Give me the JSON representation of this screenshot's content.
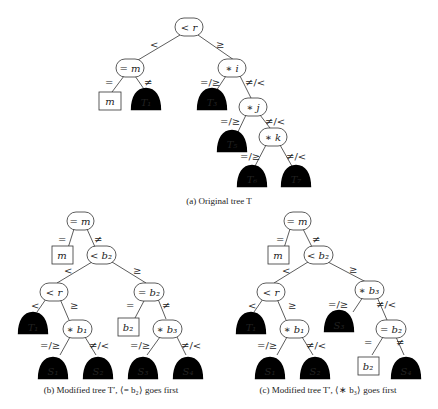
{
  "figure": {
    "tree_a": {
      "caption": "(a) Original tree T",
      "nodes": {
        "root": "< r",
        "eq_m": "= m",
        "star_i": "∗ i",
        "star_j": "∗ j",
        "star_k": "∗ k"
      },
      "leaves": {
        "m": "m"
      },
      "subtrees": {
        "T1": "T₁",
        "T3": "T₃",
        "T5": "T₅",
        "T6": "T₆",
        "T7": "T₇"
      },
      "edges": {
        "root_left": "<",
        "root_right": "≥",
        "eqm_left": "=",
        "eqm_right": "≠",
        "i_left": "=/≥",
        "i_right": "≠/<",
        "j_left": "=/≥",
        "j_right": "≠/<",
        "k_left": "=/≥",
        "k_right": "≠/<"
      }
    },
    "tree_b": {
      "caption": "(b) Modified tree T′, ⟨= b₂⟩ goes first",
      "nodes": {
        "root": "= m",
        "lt_b2": "< b₂",
        "lt_r": "< r",
        "eq_b2": "= b₂",
        "star_b1": "∗ b₁",
        "star_b3": "∗ b₃"
      },
      "leaves": {
        "m": "m",
        "b2": "b₂"
      },
      "subtrees": {
        "T1": "T₁",
        "S1": "S₁",
        "S2": "S₂",
        "S3": "S₃",
        "S4": "S₄"
      },
      "edges": {
        "root_left": "=",
        "root_right": "≠",
        "ltb2_left": "<",
        "ltb2_right": "≥",
        "ltr_left": "<",
        "ltr_right": "≥",
        "eqb2_left": "=",
        "eqb2_right": "≠",
        "b1_left": "=/≥",
        "b1_right": "≠/<",
        "b3_left": "=/≥",
        "b3_right": "≠/<"
      }
    },
    "tree_c": {
      "caption": "(c) Modified tree T′, ⟨∗ b₃⟩ goes first",
      "nodes": {
        "root": "= m",
        "lt_b2": "< b₂",
        "lt_r": "< r",
        "star_b3": "∗ b₃",
        "star_b1": "∗ b₁",
        "eq_b2": "= b₂"
      },
      "leaves": {
        "m": "m",
        "b2": "b₂"
      },
      "subtrees": {
        "T1": "T₁",
        "S1": "S₁",
        "S2": "S₂",
        "S3": "S₃",
        "S4": "S₄"
      },
      "edges": {
        "root_left": "=",
        "root_right": "≠",
        "ltb2_left": "<",
        "ltb2_right": "≥",
        "ltr_left": "<",
        "ltr_right": "≥",
        "b3_left": "=/≥",
        "b3_right": "≠/<",
        "b1_left": "=/≥",
        "b1_right": "≠/<",
        "eqb2_left": "=",
        "eqb2_right": "≠"
      }
    }
  }
}
